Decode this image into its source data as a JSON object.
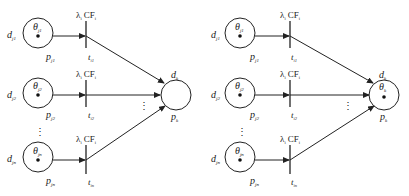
{
  "diagram": {
    "type": "fuzzy-petri-net",
    "panels": [
      {
        "name": "left",
        "inputs": [
          {
            "d": "d",
            "d_sub": "j1",
            "theta": "θ",
            "theta_sub": "j1",
            "p": "p",
            "p_sub": "j1",
            "t": "t",
            "t_sub": "i1",
            "lambda": "λ",
            "lambda_sub": "i",
            "cf": "CF",
            "cf_sub": "i"
          },
          {
            "d": "d",
            "d_sub": "j2",
            "theta": "θ",
            "theta_sub": "j2",
            "p": "p",
            "p_sub": "j2",
            "t": "t",
            "t_sub": "i2",
            "lambda": "λ",
            "lambda_sub": "i",
            "cf": "CF",
            "cf_sub": "i"
          },
          {
            "d": "d",
            "d_sub": "jn",
            "theta": "θ",
            "theta_sub": "jn",
            "p": "p",
            "p_sub": "jn",
            "t": "t",
            "t_sub": "in",
            "lambda": "λ",
            "lambda_sub": "i",
            "cf": "CF",
            "cf_sub": "i"
          }
        ],
        "output": {
          "d": "d",
          "d_sub": "k",
          "p": "p",
          "p_sub": "k",
          "theta": "",
          "theta_sub": "",
          "has_token": false
        },
        "ellipsis": "⋮"
      },
      {
        "name": "right",
        "inputs": [
          {
            "d": "d",
            "d_sub": "j1",
            "theta": "θ",
            "theta_sub": "j1",
            "p": "p",
            "p_sub": "j1",
            "t": "t",
            "t_sub": "i1",
            "lambda": "λ",
            "lambda_sub": "i",
            "cf": "CF",
            "cf_sub": "i"
          },
          {
            "d": "d",
            "d_sub": "j2",
            "theta": "θ",
            "theta_sub": "j2",
            "p": "p",
            "p_sub": "j2",
            "t": "t",
            "t_sub": "i2",
            "lambda": "λ",
            "lambda_sub": "i",
            "cf": "CF",
            "cf_sub": "i"
          },
          {
            "d": "d",
            "d_sub": "jn",
            "theta": "θ",
            "theta_sub": "jn",
            "p": "p",
            "p_sub": "jn",
            "t": "t",
            "t_sub": "in",
            "lambda": "λ",
            "lambda_sub": "i",
            "cf": "CF",
            "cf_sub": "i"
          }
        ],
        "output": {
          "d": "d",
          "d_sub": "k",
          "p": "p",
          "p_sub": "k",
          "theta": "θ",
          "theta_sub": "k",
          "has_token": true
        },
        "ellipsis": "⋮"
      }
    ],
    "colors": {
      "stroke": "#222222",
      "background": "#ffffff"
    }
  }
}
